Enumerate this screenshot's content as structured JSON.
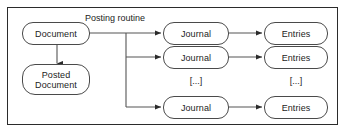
{
  "diagram": {
    "type": "flowchart",
    "title_visible": false,
    "frame": {
      "border_color": "#2b2b2b",
      "background": "#ffffff"
    },
    "stroke_color": "#4a4a4a",
    "line_color": "#555555",
    "text_color": "#1c1c1c",
    "nodes": {
      "document": {
        "label": "Document",
        "shape": "stadium"
      },
      "posted_document": {
        "line1": "Posted",
        "line2": "Document",
        "shape": "stadium"
      },
      "journal_1": {
        "label": "Journal",
        "shape": "stadium"
      },
      "journal_2": {
        "label": "Journal",
        "shape": "stadium"
      },
      "journal_3": {
        "label": "Journal",
        "shape": "stadium"
      },
      "entries_1": {
        "label": "Entries",
        "shape": "stadium"
      },
      "entries_2": {
        "label": "Entries",
        "shape": "stadium"
      },
      "entries_3": {
        "label": "Entries",
        "shape": "stadium"
      }
    },
    "edge_labels": {
      "posting_routine": "Posting routine"
    },
    "ellipsis": {
      "journal_more": "[...]",
      "entries_more": "[...]"
    }
  }
}
